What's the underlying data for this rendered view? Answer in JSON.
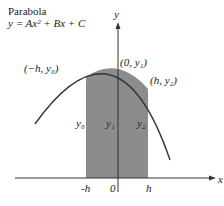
{
  "title": {
    "line1": "Parabola",
    "line2": "y = Ax² + Bx + C"
  },
  "axes": {
    "x_label": "x",
    "y_label": "y",
    "ticks": [
      "-h",
      "0",
      "h"
    ]
  },
  "points": {
    "left": "(−h, y₀)",
    "center": "(0, y₁)",
    "right": "(h, y₂)"
  },
  "heights": {
    "left": "y₀",
    "center": "y₁",
    "right": "y₂"
  },
  "colors": {
    "shade": "#8c8c8c",
    "curve": "#333333",
    "axis": "#333333"
  }
}
